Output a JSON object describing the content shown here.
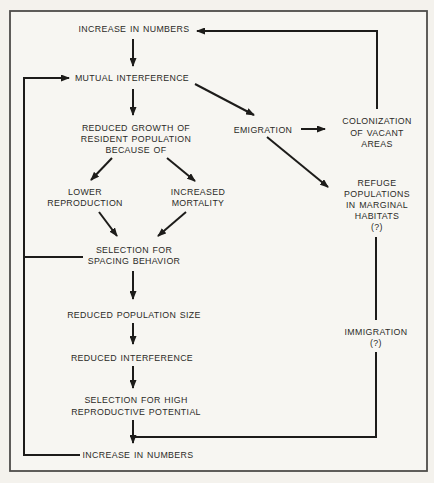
{
  "colors": {
    "bg": "#f4f2ed",
    "inner": "#f7f6f2",
    "line": "#1d1c1a",
    "text": "#2b2a27",
    "border": "#4e4d4a"
  },
  "diagram": {
    "nodes": {
      "increase_top": {
        "lines": [
          "INCREASE IN NUMBERS"
        ]
      },
      "mutual_interference": {
        "lines": [
          "MUTUAL INTERFERENCE"
        ]
      },
      "reduced_growth": {
        "lines": [
          "REDUCED GROWTH OF",
          "RESIDENT POPULATION",
          "BECAUSE OF"
        ]
      },
      "emigration": {
        "lines": [
          "EMIGRATION"
        ]
      },
      "colonization": {
        "lines": [
          "COLONIZATION",
          "OF VACANT",
          "AREAS"
        ]
      },
      "lower_reproduction": {
        "lines": [
          "LOWER",
          "REPRODUCTION"
        ]
      },
      "increased_mortality": {
        "lines": [
          "INCREASED",
          "MORTALITY"
        ]
      },
      "selection_spacing": {
        "lines": [
          "SELECTION FOR",
          "SPACING BEHAVIOR"
        ]
      },
      "refuge_populations": {
        "lines": [
          "REFUGE",
          "POPULATIONS",
          "IN MARGINAL",
          "HABITATS",
          "(?)"
        ]
      },
      "reduced_population": {
        "lines": [
          "REDUCED POPULATION SIZE"
        ]
      },
      "reduced_interference": {
        "lines": [
          "REDUCED INTERFERENCE"
        ]
      },
      "selection_high": {
        "lines": [
          "SELECTION FOR HIGH",
          "REPRODUCTIVE POTENTIAL"
        ]
      },
      "increase_bottom": {
        "lines": [
          "INCREASE IN NUMBERS"
        ]
      },
      "immigration": {
        "lines": [
          "IMMIGRATION",
          "(?)"
        ]
      }
    },
    "edges": [
      {
        "from": "colonization",
        "to": "increase_top",
        "type": "arrow"
      },
      {
        "from": "increase_top",
        "to": "mutual_interference",
        "type": "arrow"
      },
      {
        "from": "increase_bottom",
        "to": "mutual_interference",
        "type": "arrow"
      },
      {
        "from": "mutual_interference",
        "to": "reduced_growth",
        "type": "arrow"
      },
      {
        "from": "mutual_interference",
        "to": "emigration",
        "type": "arrow"
      },
      {
        "from": "emigration",
        "to": "colonization",
        "type": "arrow"
      },
      {
        "from": "emigration",
        "to": "refuge_populations",
        "type": "arrow"
      },
      {
        "from": "reduced_growth",
        "to": "lower_reproduction",
        "type": "arrow"
      },
      {
        "from": "reduced_growth",
        "to": "increased_mortality",
        "type": "arrow"
      },
      {
        "from": "lower_reproduction",
        "to": "selection_spacing",
        "type": "arrow"
      },
      {
        "from": "increased_mortality",
        "to": "selection_spacing",
        "type": "arrow"
      },
      {
        "from": "selection_spacing",
        "to": "feedback_line_left",
        "type": "line"
      },
      {
        "from": "selection_spacing",
        "to": "reduced_population",
        "type": "arrow"
      },
      {
        "from": "reduced_population",
        "to": "reduced_interference",
        "type": "arrow"
      },
      {
        "from": "reduced_interference",
        "to": "selection_high",
        "type": "arrow"
      },
      {
        "from": "selection_high",
        "to": "increase_bottom",
        "type": "arrow"
      },
      {
        "from": "refuge_populations",
        "to": "increase_bottom",
        "type": "line",
        "via": "immigration"
      }
    ]
  }
}
